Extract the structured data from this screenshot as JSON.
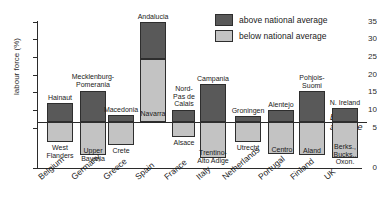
{
  "title": "",
  "legend": {
    "position": "top-right",
    "items": [
      {
        "label": "above national average",
        "color": "#595959",
        "key": "above"
      },
      {
        "label": "below national average",
        "color": "#c3c3c3",
        "key": "below"
      }
    ]
  },
  "axis": {
    "ylabel": "labour force (%)",
    "yticks": [
      "0",
      "5",
      "10",
      "15",
      "20",
      "25",
      "30",
      "35"
    ]
  },
  "reference": {
    "label_line1": "E15",
    "label_line2": "average",
    "value": 10.5
  },
  "chart_data": {
    "type": "bar",
    "title": "",
    "xlabel": "",
    "ylabel": "labour force (%)",
    "ylim": [
      0,
      35
    ],
    "grid": false,
    "legend_position": "top-right",
    "reference_line": {
      "name": "E15 average",
      "value": 10.5
    },
    "categories": [
      "Belgium",
      "Germany",
      "Greece",
      "Spain",
      "France",
      "Italy",
      "Netherlands",
      "Portugal",
      "Finland",
      "UK"
    ],
    "series": [
      {
        "name": "above national average",
        "color": "#595959",
        "description": "highest-unemployment region of each country; bar spans from E15 average up to the regional rate",
        "region_names": [
          "Hainaut",
          "Mecklenburg-Pomerania",
          "Macedonia",
          "Andalucia",
          "Nord-Pas de Calais",
          "Campania",
          "Groningen",
          "Alentejo",
          "Pohjois-Suomi",
          "N. Ireland"
        ],
        "values": [
          15.0,
          19.0,
          12.5,
          35.0,
          14.0,
          23.5,
          12.0,
          14.0,
          22.0,
          14.5
        ],
        "top_px": [
          103,
          91,
          115,
          22,
          110,
          84,
          116,
          110,
          91,
          108
        ]
      },
      {
        "name": "below national average",
        "color": "#c3c3c3",
        "description": "lowest-unemployment region of each country; bar spans from the regional rate up to the E15 average",
        "region_names": [
          "West Flanders",
          "Upper Bavaria",
          "Crete",
          "Navarra",
          "Alsace",
          "Trentino-Alto Adige",
          "Utrecht",
          "Centro",
          "Aland",
          "Berks., Bucks., Oxon."
        ],
        "values": [
          6.5,
          4.5,
          4.0,
          13.0,
          6.0,
          3.5,
          5.5,
          4.5,
          4.5,
          4.0
        ],
        "bottom_px": [
          142,
          155,
          145,
          122,
          137,
          158,
          142,
          154,
          155,
          158
        ]
      }
    ]
  },
  "bars": [
    {
      "country": "Belgium",
      "x": 47,
      "width": 26,
      "above": {
        "label": "Hainaut",
        "top": 103,
        "bottom": 122
      },
      "below": {
        "label": "West\nFlanders",
        "top": 122,
        "bottom": 142
      },
      "above_label_pos": {
        "x": 42,
        "y": 94,
        "w": 36
      },
      "below_label_pos": {
        "x": 41,
        "y": 144,
        "w": 38
      }
    },
    {
      "country": "Germany",
      "x": 80,
      "width": 26,
      "above": {
        "label": "Mecklenburg-\nPomerania",
        "top": 91,
        "bottom": 122
      },
      "below": {
        "label": "Upper\nBavaria",
        "top": 122,
        "bottom": 155
      },
      "above_label_pos": {
        "x": 67,
        "y": 73,
        "w": 52
      },
      "below_label_pos": {
        "x": 74,
        "y": 147,
        "w": 38
      }
    },
    {
      "country": "Greece",
      "x": 108,
      "width": 26,
      "above": {
        "label": "Macedonia",
        "top": 115,
        "bottom": 122
      },
      "below": {
        "label": "Crete",
        "top": 122,
        "bottom": 145
      },
      "above_label_pos": {
        "x": 101,
        "y": 106,
        "w": 40
      },
      "below_label_pos": {
        "x": 108,
        "y": 147,
        "w": 26
      }
    },
    {
      "country": "Spain",
      "x": 140,
      "width": 26,
      "above": {
        "label": "Andalucia",
        "top": 22,
        "bottom": 59
      },
      "below": {
        "label": "Navarra",
        "top": 59,
        "bottom": 122
      },
      "above_label_pos": {
        "x": 133,
        "y": 13,
        "w": 40
      },
      "below_label_pos": {
        "x": 136,
        "y": 110,
        "w": 34
      }
    },
    {
      "country": "France",
      "x": 172,
      "width": 23,
      "above": {
        "label": "Nord-\nPas de\nCalais",
        "top": 110,
        "bottom": 122
      },
      "below": {
        "label": "Alsace",
        "top": 122,
        "bottom": 137
      },
      "above_label_pos": {
        "x": 170,
        "y": 85,
        "w": 28
      },
      "below_label_pos": {
        "x": 169,
        "y": 139,
        "w": 30
      }
    },
    {
      "country": "Italy",
      "x": 200,
      "width": 26,
      "above": {
        "label": "Campania",
        "top": 84,
        "bottom": 122
      },
      "below": {
        "label": "Trentino-\nAlto Adige",
        "top": 122,
        "bottom": 158
      },
      "above_label_pos": {
        "x": 192,
        "y": 75,
        "w": 42
      },
      "below_label_pos": {
        "x": 190,
        "y": 149,
        "w": 46
      }
    },
    {
      "country": "Netherlands",
      "x": 235,
      "width": 26,
      "above": {
        "label": "Groningen",
        "top": 116,
        "bottom": 122
      },
      "below": {
        "label": "Utrecht",
        "top": 122,
        "bottom": 142
      },
      "above_label_pos": {
        "x": 227,
        "y": 107,
        "w": 42
      },
      "below_label_pos": {
        "x": 233,
        "y": 144,
        "w": 30
      }
    },
    {
      "country": "Portugal",
      "x": 268,
      "width": 26,
      "above": {
        "label": "Alentejo",
        "top": 110,
        "bottom": 122
      },
      "below": {
        "label": "Centro",
        "top": 122,
        "bottom": 154
      },
      "above_label_pos": {
        "x": 262,
        "y": 101,
        "w": 38
      },
      "below_label_pos": {
        "x": 268,
        "y": 146,
        "w": 28
      }
    },
    {
      "country": "Finland",
      "x": 299,
      "width": 26,
      "above": {
        "label": "Pohjois-\nSuomi",
        "top": 91,
        "bottom": 122
      },
      "below": {
        "label": "Aland",
        "top": 122,
        "bottom": 155
      },
      "above_label_pos": {
        "x": 295,
        "y": 74,
        "w": 34
      },
      "below_label_pos": {
        "x": 299,
        "y": 147,
        "w": 26
      }
    },
    {
      "country": "UK",
      "x": 332,
      "width": 26,
      "above": {
        "label": "N. Ireland",
        "top": 108,
        "bottom": 122
      },
      "below": {
        "label": "Berks.,\nBucks.,\nOxon.",
        "top": 122,
        "bottom": 158
      },
      "above_label_pos": {
        "x": 326,
        "y": 99,
        "w": 38
      },
      "below_label_pos": {
        "x": 329,
        "y": 143,
        "w": 32
      }
    }
  ],
  "xlabels": [
    {
      "text": "Belgium",
      "x": 36
    },
    {
      "text": "Germany",
      "x": 69
    },
    {
      "text": "Greece",
      "x": 101
    },
    {
      "text": "Spain",
      "x": 133
    },
    {
      "text": "France",
      "x": 162
    },
    {
      "text": "Italy",
      "x": 194
    },
    {
      "text": "Netherlands",
      "x": 220
    },
    {
      "text": "Portugal",
      "x": 256
    },
    {
      "text": "Finland",
      "x": 288
    },
    {
      "text": "UK",
      "x": 322
    }
  ],
  "yticks": [
    {
      "label": "35",
      "y": 22
    },
    {
      "label": "30",
      "y": 39
    },
    {
      "label": "25",
      "y": 57
    },
    {
      "label": "20",
      "y": 75
    },
    {
      "label": "15",
      "y": 92
    },
    {
      "label": "10",
      "y": 110
    },
    {
      "label": "5",
      "y": 128
    },
    {
      "label": "0",
      "y": 168
    }
  ]
}
